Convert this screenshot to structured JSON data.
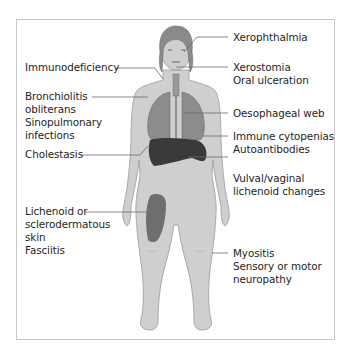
{
  "diagram": {
    "type": "anatomical-annotation",
    "colors": {
      "body_fill": "#cfcfcf",
      "body_outline": "#9a9a9a",
      "hair": "#8a8a8a",
      "lungs": "#8c8c8c",
      "liver_spleen": "#3a3a3a",
      "skin_lesion": "#6e6e6e",
      "leader_line": "#6a6a6a",
      "frame": "#c8c8c8"
    },
    "labels_left": [
      {
        "id": "immunodeficiency",
        "lines": [
          "Immunodeficiency"
        ]
      },
      {
        "id": "bronchiolitis",
        "lines": [
          "Bronchiolitis",
          "obliterans",
          "Sinopulmonary",
          "infections"
        ]
      },
      {
        "id": "cholestasis",
        "lines": [
          "Cholestasis"
        ]
      },
      {
        "id": "skin",
        "lines": [
          "Lichenoid or",
          "sclerodermatous",
          "skin",
          "Fasciitis"
        ]
      }
    ],
    "labels_right": [
      {
        "id": "xerophthalmia",
        "lines": [
          "Xerophthalmia"
        ]
      },
      {
        "id": "xerostomia",
        "lines": [
          "Xerostomia",
          "Oral ulceration"
        ]
      },
      {
        "id": "oesophageal",
        "lines": [
          "Oesophageal web"
        ]
      },
      {
        "id": "immune",
        "lines": [
          "Immune cytopenias",
          "Autoantibodies"
        ]
      },
      {
        "id": "vulval",
        "lines": [
          "Vulval/vaginal",
          "lichenoid changes"
        ]
      },
      {
        "id": "myositis",
        "lines": [
          "Myositis",
          "Sensory or motor",
          "neuropathy"
        ]
      }
    ]
  }
}
